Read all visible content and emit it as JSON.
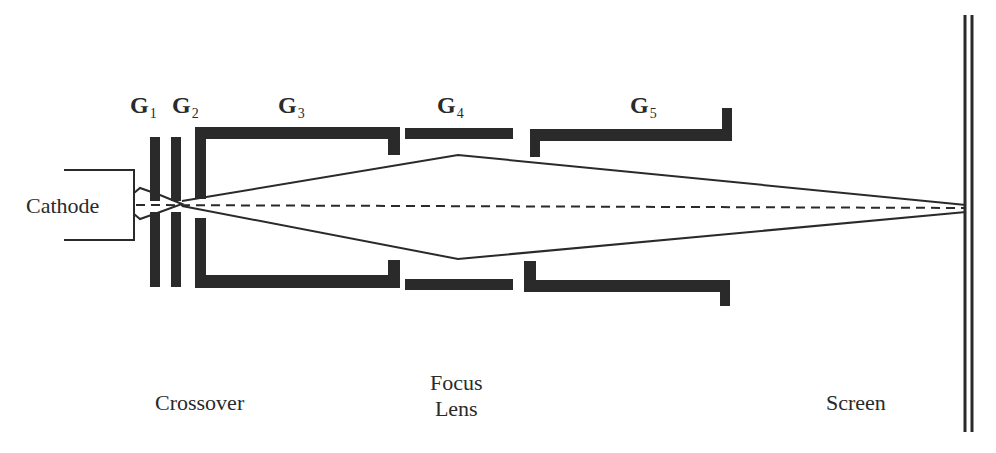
{
  "diagram": {
    "colors": {
      "ink": "#2a2a2a",
      "background": "#ffffff"
    },
    "electrodes": [
      {
        "id": "G1",
        "letter": "G",
        "subscript": "1"
      },
      {
        "id": "G2",
        "letter": "G",
        "subscript": "2"
      },
      {
        "id": "G3",
        "letter": "G",
        "subscript": "3"
      },
      {
        "id": "G4",
        "letter": "G",
        "subscript": "4"
      },
      {
        "id": "G5",
        "letter": "G",
        "subscript": "5"
      }
    ],
    "labels": {
      "cathode": "Cathode",
      "crossover": "Crossover",
      "focus_lens_line1": "Focus",
      "focus_lens_line2": "Lens",
      "screen": "Screen"
    }
  }
}
